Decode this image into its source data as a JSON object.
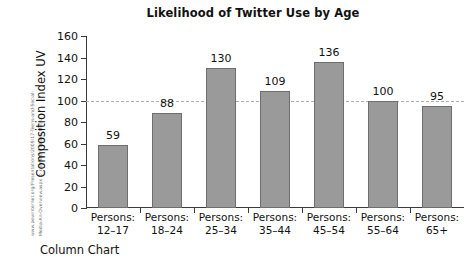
{
  "chart_data": {
    "type": "bar",
    "title": "Likelihood of Twitter Use by Age",
    "xlabel": "",
    "ylabel": "Composition Index UV",
    "categories": [
      "Persons: 12-17",
      "Persons: 18-24",
      "Persons: 25-34",
      "Persons: 35-44",
      "Persons: 45-54",
      "Persons: 55-64",
      "Persons: 65+"
    ],
    "category_lines": [
      {
        "line1": "Persons:",
        "line2": "12–17"
      },
      {
        "line1": "Persons:",
        "line2": "18–24"
      },
      {
        "line1": "Persons:",
        "line2": "25–34"
      },
      {
        "line1": "Persons:",
        "line2": "35–44"
      },
      {
        "line1": "Persons:",
        "line2": "45–54"
      },
      {
        "line1": "Persons:",
        "line2": "55–64"
      },
      {
        "line1": "Persons:",
        "line2": "65+"
      }
    ],
    "values": [
      59,
      88,
      130,
      109,
      136,
      100,
      95
    ],
    "value_labels": [
      "59",
      "88",
      "130",
      "109",
      "136",
      "100",
      "95"
    ],
    "ylim": [
      0,
      160
    ],
    "yticks": [
      0,
      20,
      40,
      60,
      80,
      100,
      120,
      140,
      160
    ],
    "ytick_labels": [
      "0",
      "20",
      "40",
      "60",
      "80",
      "100",
      "120",
      "140",
      "160"
    ],
    "grid": false,
    "legend": null,
    "reference_line": {
      "value": 100,
      "style": "dashed",
      "color": "#aeaeae"
    },
    "bar_color": "#9a9a9a",
    "bar_border_color": "#6e6e6e",
    "axis_color": "#3a3a3a"
  },
  "caption": "Column Chart",
  "source_credit": {
    "line1": "www.pewinternet.org/Presentations/2009/17-Teens-and-Social-",
    "line2": "Media-An-Overview.aspx © comScore Media Metrix"
  }
}
